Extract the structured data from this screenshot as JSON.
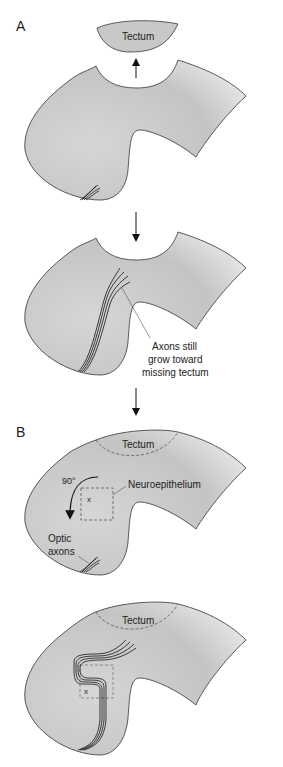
{
  "panels": {
    "a": {
      "letter": "A",
      "tectum_label": "Tectum",
      "annotation_line1": "Axons still",
      "annotation_line2": "grow toward",
      "annotation_line3": "missing tectum"
    },
    "b": {
      "letter": "B",
      "tectum_label": "Tectum",
      "rotation_label": "90°",
      "neuroepithelium_label": "Neuroepithelium",
      "optic_line1": "Optic",
      "optic_line2": "axons",
      "x_marker": "x",
      "tectum_label_2": "Tectum",
      "x_marker_2": "x"
    }
  },
  "colors": {
    "tissue_fill": "#c8c8c8",
    "tissue_stroke": "#333333",
    "axon": "#111111",
    "dashed": "#555555"
  }
}
